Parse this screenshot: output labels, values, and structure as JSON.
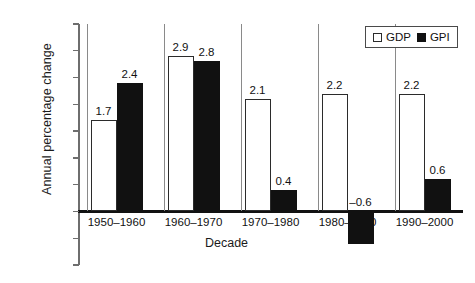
{
  "chart_data": {
    "type": "bar",
    "title": "",
    "xlabel": "Decade",
    "ylabel": "Annual percentage change",
    "categories": [
      "1950–1960",
      "1960–1970",
      "1970–1980",
      "1980–1990",
      "1990–2000"
    ],
    "series": [
      {
        "name": "GDP",
        "values": [
          1.7,
          2.9,
          2.1,
          2.2,
          2.2
        ],
        "color": "#ffffff",
        "edge_color": "#2b2b2b"
      },
      {
        "name": "GPI",
        "values": [
          2.4,
          2.8,
          0.4,
          -0.6,
          0.6
        ],
        "color": "#111111",
        "edge_color": "#111111"
      }
    ],
    "value_labels": {
      "GDP": [
        "1.7",
        "2.9",
        "2.1",
        "2.2",
        "2.2"
      ],
      "GPI": [
        "2.4",
        "2.8",
        "0.4",
        "–0.6",
        "0.6"
      ]
    },
    "ylim": [
      -1.0,
      3.5
    ],
    "yticks": [
      3.5,
      3.0,
      2.5,
      2.0,
      1.5,
      1.0,
      0.5,
      0.0,
      -0.5,
      -1.0
    ],
    "ytick_labels": [
      "3.5",
      "3.0",
      "2.5",
      "2.0",
      "1.5",
      "1.0",
      "0.5",
      "0.0",
      "–0.5",
      "–1.0"
    ],
    "grid": false,
    "legend_position": "top-right"
  },
  "legend": {
    "entries": [
      {
        "label": "GDP",
        "swatch": "open-square-swatch"
      },
      {
        "label": "GPI",
        "swatch": "filled-square-swatch"
      }
    ]
  }
}
